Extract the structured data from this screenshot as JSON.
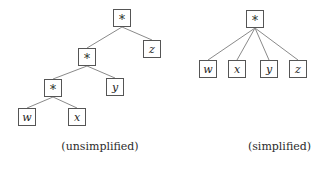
{
  "figure": {
    "title": "",
    "background_color": "#ffffff",
    "node_border_color": "#555555",
    "edge_color": "#8a8a8a",
    "text_color": "#1d1d1d"
  },
  "trees": {
    "unsimplified": {
      "caption": "(unsimplified)",
      "nodes": [
        {
          "id": "u-root",
          "label": "*",
          "kind": "operator",
          "x": 113,
          "y": 9
        },
        {
          "id": "u-mul2",
          "label": "*",
          "kind": "operator",
          "x": 78,
          "y": 48
        },
        {
          "id": "u-mul3",
          "label": "*",
          "kind": "operator",
          "x": 44,
          "y": 79
        },
        {
          "id": "u-w",
          "label": "w",
          "kind": "variable",
          "x": 18,
          "y": 108
        },
        {
          "id": "u-x",
          "label": "x",
          "kind": "variable",
          "x": 68,
          "y": 108
        },
        {
          "id": "u-y",
          "label": "y",
          "kind": "variable",
          "x": 106,
          "y": 78
        },
        {
          "id": "u-z",
          "label": "z",
          "kind": "variable",
          "x": 143,
          "y": 40
        }
      ],
      "edges": [
        {
          "from": "u-root",
          "to": "u-mul2"
        },
        {
          "from": "u-root",
          "to": "u-z"
        },
        {
          "from": "u-mul2",
          "to": "u-mul3"
        },
        {
          "from": "u-mul2",
          "to": "u-y"
        },
        {
          "from": "u-mul3",
          "to": "u-w"
        },
        {
          "from": "u-mul3",
          "to": "u-x"
        }
      ]
    },
    "simplified": {
      "caption": "(simplified)",
      "nodes": [
        {
          "id": "s-root",
          "label": "*",
          "kind": "operator",
          "x": 246,
          "y": 10
        },
        {
          "id": "s-w",
          "label": "w",
          "kind": "variable",
          "x": 199,
          "y": 60
        },
        {
          "id": "s-x",
          "label": "x",
          "kind": "variable",
          "x": 228,
          "y": 60
        },
        {
          "id": "s-y",
          "label": "y",
          "kind": "variable",
          "x": 260,
          "y": 60
        },
        {
          "id": "s-z",
          "label": "z",
          "kind": "variable",
          "x": 289,
          "y": 60
        }
      ],
      "edges": [
        {
          "from": "s-root",
          "to": "s-w"
        },
        {
          "from": "s-root",
          "to": "s-x"
        },
        {
          "from": "s-root",
          "to": "s-y"
        },
        {
          "from": "s-root",
          "to": "s-z"
        }
      ]
    }
  }
}
